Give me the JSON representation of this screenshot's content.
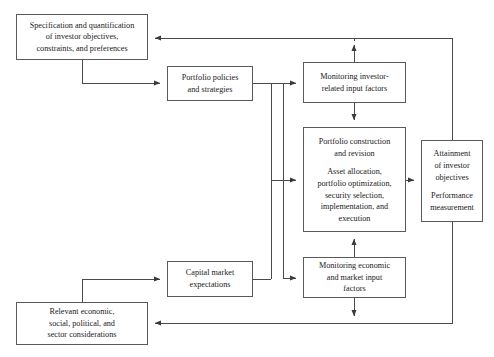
{
  "diagram": {
    "type": "flowchart",
    "stroke_color": "#5a5a5a",
    "text_color": "#1a1a1a",
    "background_color": "#ffffff",
    "nodes": {
      "specification": {
        "id": "specification",
        "lines": [
          "Specification and quantification",
          "of investor objectives,",
          "constraints, and preferences"
        ]
      },
      "policies": {
        "id": "policies",
        "lines": [
          "Portfolio policies",
          "and strategies"
        ]
      },
      "monitoring_investor": {
        "id": "monitoring_investor",
        "lines": [
          "Monitoring investor-",
          "related input factors"
        ]
      },
      "construction": {
        "id": "construction",
        "paragraph_1": [
          "Portfolio construction",
          "and revision"
        ],
        "paragraph_2": [
          "Asset allocation,",
          "portfolio optimization,",
          "security selection,",
          "implementation, and",
          "execution"
        ]
      },
      "attainment": {
        "id": "attainment",
        "paragraph_1": [
          "Attainment",
          "of investor",
          "objectives"
        ],
        "paragraph_2": [
          "Performance",
          "measurement"
        ]
      },
      "capital_market": {
        "id": "capital_market",
        "lines": [
          "Capital market",
          "expectations"
        ]
      },
      "monitoring_economic": {
        "id": "monitoring_economic",
        "lines": [
          "Monitoring economic",
          "and market input",
          "factors"
        ]
      },
      "relevant_considerations": {
        "id": "relevant_considerations",
        "lines": [
          "Relevant economic,",
          "social, political, and",
          "sector considerations"
        ]
      }
    },
    "edges": [
      {
        "id": "spec-to-policies",
        "from": "specification",
        "to": "policies"
      },
      {
        "id": "policies-to-mon-investor",
        "from": "policies",
        "to": "monitoring_investor"
      },
      {
        "id": "policies-to-construction",
        "from": "policies",
        "to": "construction"
      },
      {
        "id": "policies-to-mon-economic",
        "from": "policies",
        "to": "monitoring_economic"
      },
      {
        "id": "mon-investor-to-construction",
        "from": "monitoring_investor",
        "to": "construction"
      },
      {
        "id": "mon-investor-to-spec",
        "from": "monitoring_investor",
        "to": "specification"
      },
      {
        "id": "construction-to-attainment",
        "from": "construction",
        "to": "attainment"
      },
      {
        "id": "mon-economic-to-construction",
        "from": "monitoring_economic",
        "to": "construction"
      },
      {
        "id": "mon-economic-to-relevant",
        "from": "monitoring_economic",
        "to": "relevant_considerations"
      },
      {
        "id": "relevant-to-capital",
        "from": "relevant_considerations",
        "to": "capital_market"
      },
      {
        "id": "capital-to-mon-economic",
        "from": "capital_market",
        "to": "monitoring_economic"
      },
      {
        "id": "capital-to-construction",
        "from": "capital_market",
        "to": "construction"
      },
      {
        "id": "attainment-to-spec",
        "from": "attainment",
        "to": "specification"
      },
      {
        "id": "attainment-to-relevant",
        "from": "attainment",
        "to": "relevant_considerations"
      }
    ]
  }
}
